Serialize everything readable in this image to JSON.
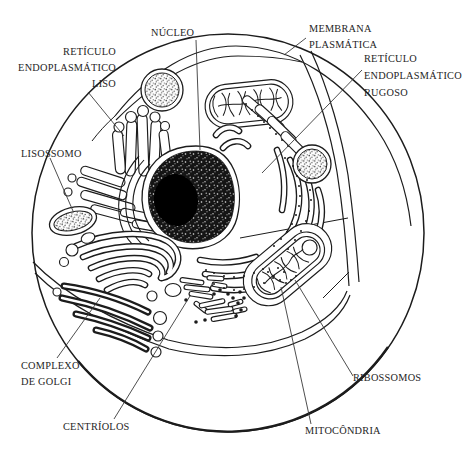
{
  "figure": {
    "type": "diagram",
    "colors": {
      "ink": "#1c1c1c",
      "paper": "#ffffff",
      "leader": "#3a3a3a"
    },
    "labels": {
      "nucleo": "NÚCLEO",
      "membrana_plasmatica": "MEMBRANA\nPLASMÁTICA",
      "reticulo_endoplasmatico_rugoso": "RETÍCULO\nENDOPLASMÁTICO\nRUGOSO",
      "reticulo_endoplasmatico_liso": "RETÍCULO\nENDOPLASMÁTICO\nLISO",
      "lisossomo": "LISOSSOMO",
      "complexo_de_golgi": "COMPLEXO\nDE GOLGI",
      "centriolos": "CENTRÍOLOS",
      "ribossomos": "RIBOSSOMOS",
      "mitocondria": "MITOCÔNDRIA"
    }
  }
}
